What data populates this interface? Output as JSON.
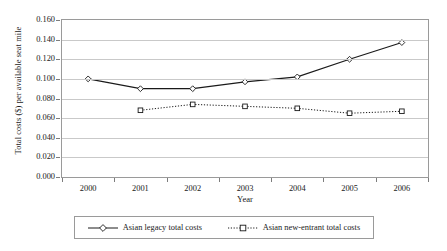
{
  "chart_data": {
    "type": "line",
    "title": "",
    "xlabel": "Year",
    "ylabel": "Total costs ($) per available seat mile",
    "categories": [
      "2000",
      "2001",
      "2002",
      "2003",
      "2004",
      "2005",
      "2006"
    ],
    "x": [
      2000,
      2001,
      2002,
      2003,
      2004,
      2005,
      2006
    ],
    "ylim": [
      0.0,
      0.16
    ],
    "ytick_labels": [
      "0.000",
      "0.020",
      "0.040",
      "0.060",
      "0.080",
      "0.100",
      "0.120",
      "0.140",
      "0.160"
    ],
    "ytick_values": [
      0.0,
      0.02,
      0.04,
      0.06,
      0.08,
      0.1,
      0.12,
      0.14,
      0.16
    ],
    "grid": true,
    "legend_position": "bottom",
    "series": [
      {
        "name": "Asian legacy total costs",
        "values": [
          0.1,
          0.09,
          0.09,
          0.097,
          0.102,
          0.12,
          0.137
        ],
        "line_style": "solid",
        "marker": "diamond",
        "color": "#1a1a1a"
      },
      {
        "name": "Asian new-entrant total costs",
        "values": [
          null,
          0.068,
          0.074,
          0.072,
          0.07,
          0.065,
          0.067
        ],
        "line_style": "dotted",
        "marker": "square",
        "color": "#1a1a1a"
      }
    ]
  },
  "legend": {
    "entries": [
      {
        "label": "Asian legacy total costs"
      },
      {
        "label": "Asian new-entrant total costs"
      }
    ]
  },
  "colors": {
    "foreground": "#1a1a1a",
    "gridline": "#c9c9c9",
    "frame": "#9a9a9a",
    "background": "#ffffff"
  }
}
